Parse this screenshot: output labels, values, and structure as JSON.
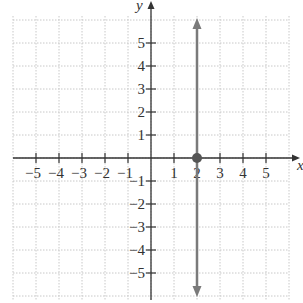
{
  "chart_data": {
    "type": "line",
    "title": "",
    "xlabel": "x",
    "ylabel": "y",
    "xlim": [
      -6,
      6
    ],
    "ylim": [
      -6,
      6
    ],
    "grid": true,
    "grid_style": "dotted",
    "x_ticks": [
      -5,
      -4,
      -3,
      -2,
      -1,
      1,
      2,
      3,
      4,
      5
    ],
    "x_tick_labels": [
      "−5",
      "−4",
      "−3",
      "−2",
      "−1",
      "1",
      "2",
      "3",
      "4",
      "5"
    ],
    "y_ticks": [
      -5,
      -4,
      -3,
      -2,
      -1,
      1,
      2,
      3,
      4,
      5
    ],
    "y_tick_labels": [
      "−5",
      "−4",
      "−3",
      "−2",
      "−1",
      "1",
      "2",
      "3",
      "4",
      "5"
    ],
    "series": [
      {
        "name": "x = 2",
        "kind": "vertical-line",
        "x": 2,
        "arrows": "both",
        "color": "#7a7a7a"
      }
    ],
    "points": [
      {
        "x": 2,
        "y": 0,
        "color": "#555555"
      }
    ],
    "legend": null
  },
  "colors": {
    "axis": "#333333",
    "grid": "#c8c8c8",
    "line": "#7a7a7a",
    "point": "#555555"
  }
}
